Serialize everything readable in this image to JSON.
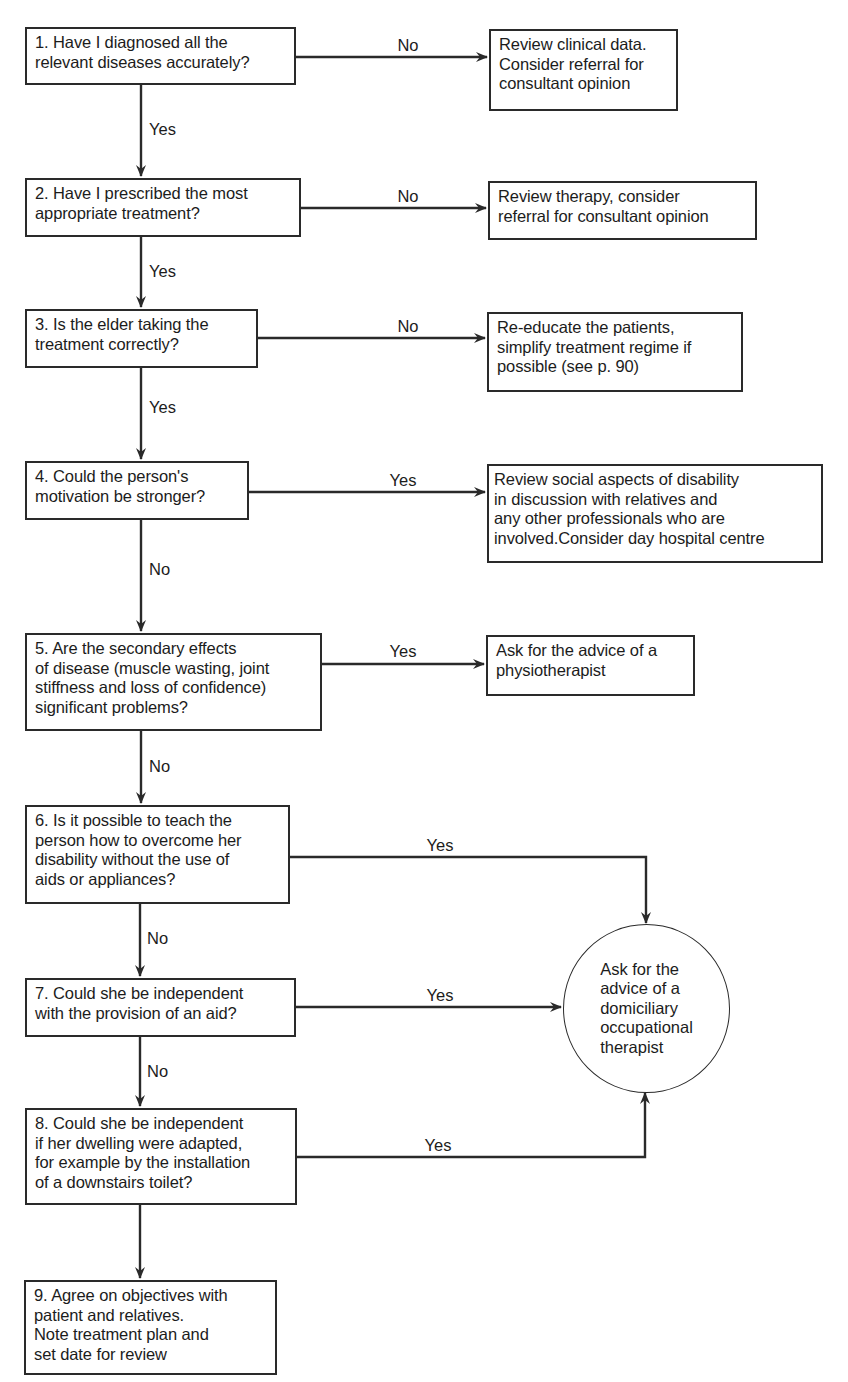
{
  "diagram": {
    "type": "flowchart",
    "questions": [
      {
        "id": 1,
        "text": "1.  Have I diagnosed all the\nrelevant diseases accurately?",
        "branch_label": "No",
        "down_label": "Yes"
      },
      {
        "id": 2,
        "text": "2. Have I prescribed the most\nappropriate  treatment?",
        "branch_label": "No",
        "down_label": "Yes"
      },
      {
        "id": 3,
        "text": "3.  Is the elder taking the\ntreatment correctly?",
        "branch_label": "No",
        "down_label": "Yes"
      },
      {
        "id": 4,
        "text": "4.  Could the person's\nmotivation be stronger?",
        "branch_label": "Yes",
        "down_label": "No"
      },
      {
        "id": 5,
        "text": "5.  Are the secondary effects\nof disease (muscle wasting, joint\nstiffness and loss of confidence)\nsignificant problems?",
        "branch_label": "Yes",
        "down_label": "No"
      },
      {
        "id": 6,
        "text": "6.  Is it possible to teach the\nperson how to overcome her\ndisability without the use of\naids or appliances?",
        "branch_label": "Yes",
        "down_label": "No"
      },
      {
        "id": 7,
        "text": "7.  Could she be independent\nwith the provision of an aid?",
        "branch_label": "Yes",
        "down_label": "No"
      },
      {
        "id": 8,
        "text": "8.  Could she be independent\nif her dwelling were adapted,\nfor example by the installation\nof a downstairs toilet?",
        "branch_label": "Yes",
        "down_label": ""
      },
      {
        "id": 9,
        "text": "9.  Agree on objectives with\npatient and relatives.\nNote treatment plan and\nset date for review"
      }
    ],
    "actions": [
      {
        "for": 1,
        "text": "Review clinical data.\nConsider referral for\nconsultant opinion"
      },
      {
        "for": 2,
        "text": "Review therapy, consider\nreferral for consultant opinion"
      },
      {
        "for": 3,
        "text": "Re-educate the patients,\nsimplify treatment regime if\npossible (see p. 90)"
      },
      {
        "for": 4,
        "text": "Review social aspects of disability\nin discussion with relatives and\nany other professionals who are\ninvolved.Consider day hospital centre"
      },
      {
        "for": 5,
        "text": "Ask for the advice of a\nphysiotherapist"
      }
    ],
    "terminal_circle": {
      "for": [
        6,
        7,
        8
      ],
      "text": "Ask for the\nadvice of a\ndomiciliary\noccupational\ntherapist"
    },
    "colors": {
      "line": "#2a2a2a",
      "text": "#1c1c1c",
      "background": "#ffffff"
    }
  }
}
